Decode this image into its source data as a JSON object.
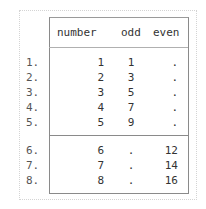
{
  "table": {
    "columns": [
      "number",
      "odd",
      "even"
    ],
    "rows": [
      {
        "label": "1.",
        "number": "1",
        "odd": "1",
        "even": "."
      },
      {
        "label": "2.",
        "number": "2",
        "odd": "3",
        "even": "."
      },
      {
        "label": "3.",
        "number": "3",
        "odd": "5",
        "even": "."
      },
      {
        "label": "4.",
        "number": "4",
        "odd": "7",
        "even": "."
      },
      {
        "label": "5.",
        "number": "5",
        "odd": "9",
        "even": "."
      },
      {
        "label": "6.",
        "number": "6",
        "odd": ".",
        "even": "12"
      },
      {
        "label": "7.",
        "number": "7",
        "odd": ".",
        "even": "14"
      },
      {
        "label": "8.",
        "number": "8",
        "odd": ".",
        "even": "16"
      }
    ]
  }
}
